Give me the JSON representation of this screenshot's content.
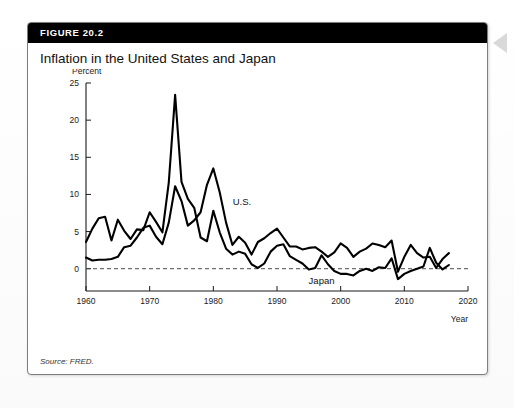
{
  "figure": {
    "header_label": "FIGURE 20.2",
    "title": "Inflation in the United States and Japan",
    "source": "Source: FRED."
  },
  "chart_data": {
    "type": "line",
    "title": "Inflation in the United States and Japan",
    "xlabel": "Year",
    "ylabel": "Percent",
    "xlim": [
      1960,
      2020
    ],
    "ylim": [
      -3,
      25
    ],
    "xticks": [
      1960,
      1970,
      1980,
      1990,
      2000,
      2010,
      2020
    ],
    "yticks": [
      0,
      5,
      10,
      15,
      20,
      25
    ],
    "grid": false,
    "zero_reference_line": 0,
    "legend": "inline-labels",
    "annotations": [
      {
        "text": "U.S.",
        "x": 1984.5,
        "y": 8.6
      },
      {
        "text": "Japan",
        "x": 1997.0,
        "y": -2.1
      }
    ],
    "x": [
      1960,
      1961,
      1962,
      1963,
      1964,
      1965,
      1966,
      1967,
      1968,
      1969,
      1970,
      1971,
      1972,
      1973,
      1974,
      1975,
      1976,
      1977,
      1978,
      1979,
      1980,
      1981,
      1982,
      1983,
      1984,
      1985,
      1986,
      1987,
      1988,
      1989,
      1990,
      1991,
      1992,
      1993,
      1994,
      1995,
      1996,
      1997,
      1998,
      1999,
      2000,
      2001,
      2002,
      2003,
      2004,
      2005,
      2006,
      2007,
      2008,
      2009,
      2010,
      2011,
      2012,
      2013,
      2014,
      2015,
      2016,
      2017
    ],
    "series": [
      {
        "name": "Japan",
        "values": [
          3.6,
          5.4,
          6.8,
          7.0,
          3.8,
          6.6,
          5.1,
          4.0,
          5.3,
          5.2,
          7.6,
          6.3,
          4.9,
          11.6,
          23.4,
          11.7,
          9.4,
          8.2,
          4.2,
          3.7,
          7.8,
          4.9,
          2.7,
          1.9,
          2.3,
          2.0,
          0.6,
          0.1,
          0.7,
          2.3,
          3.1,
          3.3,
          1.7,
          1.2,
          0.7,
          -0.1,
          0.1,
          1.8,
          0.6,
          -0.3,
          -0.7,
          -0.7,
          -0.9,
          -0.3,
          0.0,
          -0.3,
          0.2,
          0.1,
          1.4,
          -1.4,
          -0.7,
          -0.3,
          0.0,
          0.3,
          2.8,
          0.8,
          -0.1,
          0.5
        ]
      },
      {
        "name": "U.S.",
        "values": [
          1.5,
          1.1,
          1.2,
          1.2,
          1.3,
          1.6,
          2.9,
          3.1,
          4.2,
          5.5,
          5.8,
          4.3,
          3.3,
          6.2,
          11.1,
          9.1,
          5.8,
          6.5,
          7.6,
          11.3,
          13.5,
          10.3,
          6.2,
          3.2,
          4.3,
          3.5,
          1.9,
          3.6,
          4.1,
          4.8,
          5.4,
          4.2,
          3.0,
          3.0,
          2.6,
          2.8,
          2.9,
          2.3,
          1.6,
          2.2,
          3.4,
          2.8,
          1.6,
          2.3,
          2.7,
          3.4,
          3.2,
          2.9,
          3.8,
          -0.4,
          1.6,
          3.2,
          2.1,
          1.5,
          1.6,
          0.1,
          1.3,
          2.1
        ]
      }
    ]
  }
}
